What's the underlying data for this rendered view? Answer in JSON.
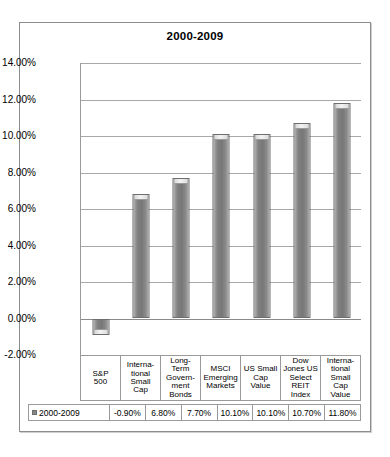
{
  "chart_data": {
    "type": "bar",
    "title": "2000-2009",
    "xlabel": "",
    "ylabel": "",
    "ylim": [
      -2.0,
      14.0
    ],
    "ytick_labels": [
      "14.00%",
      "12.00%",
      "10.00%",
      "8.00%",
      "6.00%",
      "4.00%",
      "2.00%",
      "0.00%",
      "-2.00%"
    ],
    "ytick_values": [
      14.0,
      12.0,
      10.0,
      8.0,
      6.0,
      4.0,
      2.0,
      0.0,
      -2.0
    ],
    "grid": true,
    "legend_position": "bottom-table",
    "categories": [
      "S&P 500",
      "International Small Cap",
      "Long-Term Government Bonds",
      "MSCI Emerging Markets",
      "US Small Cap Value",
      "Dow Jones US Select REIT Index",
      "International Small Cap Value"
    ],
    "category_label_lines": [
      [
        "S&P",
        "500"
      ],
      [
        "Interna-",
        "tional",
        "Small",
        "Cap"
      ],
      [
        "Long-",
        "Term",
        "Govern-",
        "ment",
        "Bonds"
      ],
      [
        "MSCI",
        "Emerging",
        "Markets"
      ],
      [
        "US Small",
        "Cap",
        "Value"
      ],
      [
        "Dow",
        "Jones US",
        "Select",
        "REIT",
        "Index"
      ],
      [
        "Interna-",
        "tional",
        "Small",
        "Cap",
        "Value"
      ]
    ],
    "series": [
      {
        "name": "2000-2009",
        "values": [
          -0.9,
          6.8,
          7.7,
          10.1,
          10.1,
          10.7,
          11.8
        ],
        "value_labels": [
          "-0.90%",
          "6.80%",
          "7.70%",
          "10.10%",
          "10.10%",
          "10.70%",
          "11.80%"
        ],
        "color": "#878787"
      }
    ]
  },
  "colors": {
    "bar_fill": "#878787",
    "bar_border": "#6e6e6e",
    "gridline": "#a8a8a8",
    "frame_border": "#8d8d8d",
    "background": "#ffffff",
    "text": "#000000"
  },
  "icons": {
    "legend_swatch": "legend-swatch-icon"
  }
}
